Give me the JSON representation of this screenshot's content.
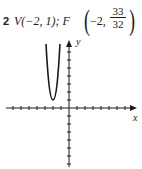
{
  "problem": {
    "number": "2",
    "vertex_label": "V(−2, 1);",
    "focus_prefix": "F",
    "focus_x": "−2,",
    "focus_y_numerator": "33",
    "focus_y_denominator": "32"
  },
  "graph": {
    "x_axis_label": "x",
    "y_axis_label": "y",
    "equation_hint": "parabola opening upward",
    "vertex": [
      -2,
      1
    ],
    "focus": [
      -2,
      1.03125
    ],
    "tick_spacing_units": 1,
    "x_range": [
      -8,
      7
    ],
    "y_range": [
      -7,
      7
    ],
    "curve_color": "#1a1a1a",
    "axis_color": "#1a1a1a"
  }
}
